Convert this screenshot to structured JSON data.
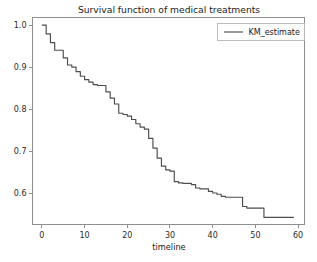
{
  "chart_data": {
    "type": "line",
    "title": "Survival function of medical treatments",
    "xlabel": "timeline",
    "ylabel": "",
    "xlim": [
      -2.2,
      61.5
    ],
    "ylim": [
      0.525,
      1.018
    ],
    "grid": false,
    "legend_position": "upper right",
    "step": "post",
    "xticks": [
      0,
      10,
      20,
      30,
      40,
      50,
      60
    ],
    "xticklabels": [
      "0",
      "10",
      "20",
      "30",
      "40",
      "50",
      "60"
    ],
    "yticks": [
      0.6,
      0.7,
      0.8,
      0.9,
      1.0
    ],
    "yticklabels": [
      "0.6",
      "0.7",
      "0.8",
      "0.9",
      "1.0"
    ],
    "series": [
      {
        "name": "KM_estimate",
        "color": "#4d4d4d",
        "x": [
          0,
          1,
          2,
          3,
          4,
          5,
          6,
          7,
          8,
          9,
          10,
          11,
          12,
          13,
          14,
          15,
          16,
          17,
          18,
          19,
          20,
          21,
          22,
          23,
          24,
          25,
          26,
          27,
          28,
          29,
          30,
          31,
          32,
          33,
          34,
          35,
          36,
          37,
          38,
          39,
          40,
          41,
          42,
          43,
          44,
          45,
          46,
          47,
          48,
          49,
          50,
          51,
          52,
          53,
          54,
          55,
          56,
          57,
          58,
          59
        ],
        "values": [
          1.0,
          0.979,
          0.958,
          0.94,
          0.94,
          0.922,
          0.905,
          0.9,
          0.889,
          0.878,
          0.87,
          0.864,
          0.858,
          0.856,
          0.856,
          0.841,
          0.826,
          0.812,
          0.79,
          0.787,
          0.783,
          0.775,
          0.765,
          0.757,
          0.752,
          0.73,
          0.707,
          0.683,
          0.664,
          0.655,
          0.652,
          0.627,
          0.624,
          0.623,
          0.623,
          0.62,
          0.612,
          0.61,
          0.61,
          0.604,
          0.6,
          0.597,
          0.592,
          0.59,
          0.59,
          0.59,
          0.59,
          0.568,
          0.564,
          0.564,
          0.564,
          0.564,
          0.542,
          0.542,
          0.542,
          0.542,
          0.542,
          0.542,
          0.542,
          0.542
        ]
      }
    ]
  },
  "legend": {
    "entries": [
      {
        "label": "KM_estimate"
      }
    ]
  }
}
